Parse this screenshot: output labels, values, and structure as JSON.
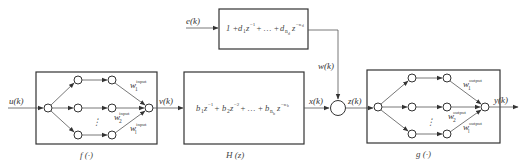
{
  "diagram": {
    "type": "block-diagram",
    "signals": {
      "input": "u(k)",
      "f_output": "v(k)",
      "h_output": "x(k)",
      "noise_input": "e(k)",
      "noise_output": "w(k)",
      "sum_output": "z(k)",
      "output": "y(k)"
    },
    "blocks": {
      "f": {
        "caption": "f(·)",
        "weights": [
          {
            "base": "w",
            "sub": "1",
            "sup": "input"
          },
          {
            "base": "w",
            "sub": "2",
            "sup": "input"
          },
          {
            "base": "w",
            "sub": "l",
            "sup": "input"
          }
        ],
        "ellipsis": "⋮"
      },
      "h": {
        "caption": "H(z)",
        "equation": {
          "terms": [
            {
              "coef": "b",
              "sub": "1",
              "pow": "−1"
            },
            {
              "coef": "b",
              "sub": "2",
              "pow": "−2"
            },
            {
              "coef": "b",
              "sub": "n_b",
              "pow": "−n_b"
            }
          ],
          "text": "b₁z⁻¹ + b₂z⁻² + … + b_{n_b}z^{−n_b}"
        }
      },
      "noise": {
        "equation": {
          "text": "1 + d₁z⁻¹ + … + d_{n_d}z^{−n_d}"
        }
      },
      "g": {
        "caption": "g(·)",
        "weights": [
          {
            "base": "w",
            "sub": "1",
            "sup": "output"
          },
          {
            "base": "w",
            "sub": "2",
            "sup": "output"
          },
          {
            "base": "w",
            "sub": "l",
            "sup": "output"
          }
        ],
        "ellipsis": "⋮"
      }
    },
    "text": {
      "u": "u(k)",
      "v": "v(k)",
      "x": "x(k)",
      "e": "e(k)",
      "w": "w(k)",
      "z": "z(k)",
      "y": "y(k)",
      "f_cap": "f (·)",
      "h_cap": "H (z)",
      "g_cap": "g (·)",
      "one_plus": "1 + ",
      "d": "d",
      "d1_sub": "1",
      "dn_sub": "n",
      "dn_subsub": "d",
      "zinv": "z",
      "pow_m1": "−1",
      "pow_mnd": "−n",
      "pow_mnd_sub": "d",
      "plus_dots_plus": " + … + ",
      "b": "b",
      "b1_sub": "1",
      "b2_sub": "2",
      "bn_sub": "n",
      "bn_subsub": "b",
      "pow_m2": "−2",
      "pow_mnb": "−n",
      "pow_mnb_sub": "b",
      "plus": " + ",
      "w_base": "w",
      "sub1": "1",
      "sub2": "2",
      "subl": "l",
      "sup_input": "input",
      "sup_output": "output",
      "vdots": "⋮"
    }
  }
}
